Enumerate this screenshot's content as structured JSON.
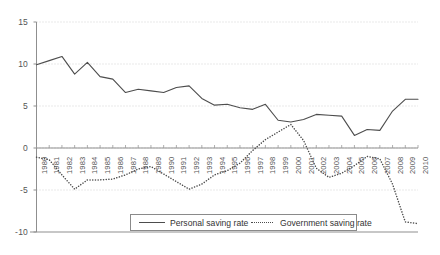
{
  "chart_data": {
    "type": "line",
    "title": "",
    "xlabel": "",
    "ylabel": "",
    "ylim": [
      -10,
      15
    ],
    "yticks": [
      15,
      10,
      5,
      0,
      -5,
      -10
    ],
    "ytick_labels": [
      "15",
      "10",
      "5",
      "0",
      "-5",
      "-10"
    ],
    "grid": true,
    "grid_style": "dotted-horizontal",
    "legend_position": "bottom-center",
    "categories": [
      "1980",
      "1981",
      "1982",
      "1983",
      "1984",
      "1985",
      "1986",
      "1987",
      "1988",
      "1989",
      "1990",
      "1991",
      "1992",
      "1993",
      "1994",
      "1995",
      "1996",
      "1997",
      "1998",
      "1999",
      "2000",
      "2001",
      "2002",
      "2003",
      "2004",
      "2005",
      "2006",
      "2007",
      "2008",
      "2009",
      "2010"
    ],
    "series": [
      {
        "name": "Personal saving rate",
        "style": "solid",
        "color": "#4d4d4d",
        "values": [
          9.9,
          10.4,
          10.9,
          8.8,
          10.2,
          8.5,
          8.2,
          6.6,
          7.0,
          6.8,
          6.6,
          7.2,
          7.4,
          5.9,
          5.1,
          5.2,
          4.8,
          4.6,
          5.2,
          3.3,
          3.1,
          3.4,
          4.0,
          3.9,
          3.8,
          1.5,
          2.2,
          2.1,
          4.4,
          5.8,
          5.8
        ]
      },
      {
        "name": "Government saving rate",
        "style": "dotted",
        "color": "#4d4d4d",
        "values": [
          -1.1,
          -1.4,
          -3.2,
          -4.9,
          -3.8,
          -3.8,
          -3.7,
          -3.2,
          -2.5,
          -2.2,
          -3.1,
          -4.0,
          -4.9,
          -4.3,
          -3.2,
          -2.7,
          -1.8,
          -0.3,
          1.0,
          1.9,
          2.8,
          0.9,
          -2.4,
          -3.5,
          -3.0,
          -2.1,
          -1.0,
          -1.3,
          -4.3,
          -8.8,
          -9.0
        ]
      }
    ]
  },
  "legend": {
    "entries": [
      {
        "label": "Personal saving rate"
      },
      {
        "label": "Government saving rate"
      }
    ]
  }
}
